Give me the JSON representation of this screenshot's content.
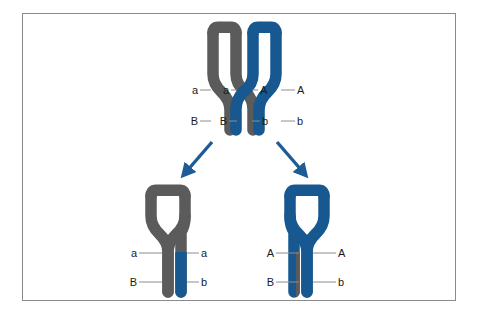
{
  "figure": {
    "background_color": "#ffffff",
    "frame_border_color": "#8a8a8e"
  },
  "colors": {
    "maternal_gray": "#5b5b5b",
    "paternal_blue": "#16588f",
    "arrow_blue": "#1d5c96",
    "leader_line": "#8d8d8d",
    "label_text": "#1a1a1a"
  },
  "top_stage": {
    "name": "bivalent-with-chiasma",
    "chromosomes": [
      {
        "id": "maternal-homolog",
        "color_key": "paternal? no",
        "color": "#5b5b5b",
        "chromatids": [
          "outer-gray-chromatid",
          "inner-gray-chromatid"
        ],
        "alleles": {
          "upper": "a",
          "lower": "B"
        }
      },
      {
        "id": "paternal-homolog",
        "color": "#16588f",
        "chromatids": [
          "inner-blue-chromatid",
          "outer-blue-chromatid"
        ],
        "alleles": {
          "upper": "A",
          "lower": "b"
        }
      }
    ],
    "chiasma": {
      "name": "crossover-point",
      "between": [
        "inner-gray-chromatid",
        "inner-blue-chromatid"
      ]
    },
    "labels": {
      "upper_row": [
        "a",
        "a",
        "A",
        "A"
      ],
      "lower_row": [
        "B",
        "B",
        "b",
        "b"
      ]
    }
  },
  "arrows": [
    {
      "name": "arrow-to-left-product",
      "direction": "down-left",
      "color": "#1d5c96"
    },
    {
      "name": "arrow-to-right-product",
      "direction": "down-right",
      "color": "#1d5c96"
    }
  ],
  "bottom_stage": {
    "products": [
      {
        "id": "recombinant-chromosome-left",
        "base_color": "#5b5b5b",
        "recombinant_segment_color": "#16588f",
        "recombinant_segment_arm": "lower-right",
        "labels": {
          "upper_left": "a",
          "upper_right": "a",
          "lower_left": "B",
          "lower_right": "b"
        }
      },
      {
        "id": "recombinant-chromosome-right",
        "base_color": "#16588f",
        "recombinant_segment_color": "#5b5b5b",
        "recombinant_segment_arm": "lower-left",
        "labels": {
          "upper_left": "A",
          "upper_right": "A",
          "lower_left": "B",
          "lower_right": "b"
        }
      }
    ]
  }
}
